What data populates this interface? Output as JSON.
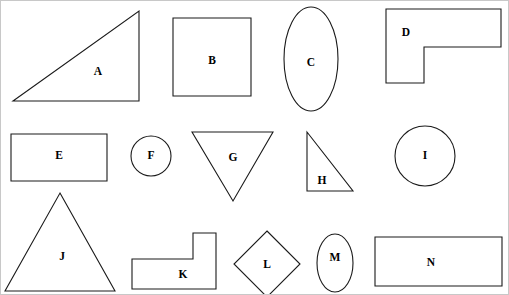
{
  "figure": {
    "width": 509,
    "height": 295,
    "background_color": "#ffffff",
    "stroke_color": "#1a1a1a",
    "label_color": "#000000",
    "border_color": "#c8c8c8"
  },
  "shapes": [
    {
      "label": "A",
      "kind": "right-triangle",
      "row": 1,
      "geometry": {
        "type": "polygon",
        "points": "138,10 138,100 12,100"
      },
      "label_pos": {
        "x": 97,
        "y": 71
      }
    },
    {
      "label": "B",
      "kind": "square",
      "row": 1,
      "geometry": {
        "type": "rect",
        "x": 172,
        "y": 17,
        "width": 78,
        "height": 78
      },
      "label_pos": {
        "x": 211,
        "y": 60
      }
    },
    {
      "label": "C",
      "kind": "ellipse-vertical",
      "row": 1,
      "geometry": {
        "type": "ellipse",
        "cx": 310,
        "cy": 58,
        "rx": 27,
        "ry": 52
      },
      "label_pos": {
        "x": 310,
        "y": 62
      }
    },
    {
      "label": "D",
      "kind": "l-shape",
      "row": 1,
      "geometry": {
        "type": "polygon",
        "points": "385,8 500,8 500,46 423,46 423,82 385,82"
      },
      "label_pos": {
        "x": 405,
        "y": 32
      }
    },
    {
      "label": "E",
      "kind": "rectangle",
      "row": 2,
      "geometry": {
        "type": "rect",
        "x": 10,
        "y": 133,
        "width": 96,
        "height": 47
      },
      "label_pos": {
        "x": 58,
        "y": 155
      }
    },
    {
      "label": "F",
      "kind": "circle-small",
      "row": 2,
      "geometry": {
        "type": "circle",
        "cx": 150,
        "cy": 155,
        "r": 20
      },
      "label_pos": {
        "x": 150,
        "y": 155
      }
    },
    {
      "label": "G",
      "kind": "inverted-triangle",
      "row": 2,
      "geometry": {
        "type": "polygon",
        "points": "191,131 272,131 232,200"
      },
      "label_pos": {
        "x": 232,
        "y": 157
      }
    },
    {
      "label": "H",
      "kind": "right-triangle",
      "row": 2,
      "geometry": {
        "type": "polygon",
        "points": "306,131 306,190 352,190"
      },
      "label_pos": {
        "x": 321,
        "y": 180
      }
    },
    {
      "label": "I",
      "kind": "circle",
      "row": 2,
      "geometry": {
        "type": "circle",
        "cx": 424,
        "cy": 155,
        "r": 30
      },
      "label_pos": {
        "x": 424,
        "y": 155
      }
    },
    {
      "label": "J",
      "kind": "isosceles-triangle",
      "row": 3,
      "geometry": {
        "type": "polygon",
        "points": "59,192 114,290 4,290"
      },
      "label_pos": {
        "x": 61,
        "y": 256
      }
    },
    {
      "label": "K",
      "kind": "l-shape",
      "row": 3,
      "geometry": {
        "type": "polygon",
        "points": "192,232 215,232 215,288 131,288 131,258 192,258"
      },
      "label_pos": {
        "x": 182,
        "y": 274
      }
    },
    {
      "label": "L",
      "kind": "diamond",
      "row": 3,
      "geometry": {
        "type": "polygon",
        "points": "266,230 299,263 266,296 233,263"
      },
      "label_pos": {
        "x": 266,
        "y": 264
      }
    },
    {
      "label": "M",
      "kind": "ellipse-vertical",
      "row": 3,
      "geometry": {
        "type": "ellipse",
        "cx": 334,
        "cy": 262,
        "rx": 18,
        "ry": 29
      },
      "label_pos": {
        "x": 334,
        "y": 257
      }
    },
    {
      "label": "N",
      "kind": "rectangle",
      "row": 3,
      "geometry": {
        "type": "rect",
        "x": 374,
        "y": 236,
        "width": 127,
        "height": 49
      },
      "label_pos": {
        "x": 430,
        "y": 262
      }
    }
  ]
}
